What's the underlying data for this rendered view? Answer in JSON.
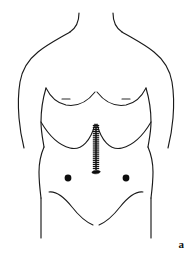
{
  "figure": {
    "panel_label": "a",
    "caption_alt": "Anterior view of male torso showing midline laparotomy incision closed with staples extending from xiphoid process to umbilicus, with two lateral port sites",
    "background_color": "#ffffff",
    "line_color": "#1a1a1a",
    "mark_color": "#0d0d0d",
    "width": 192,
    "height": 259
  },
  "anatomy": {
    "regions": [
      {
        "name": "neck",
        "label": "Neck"
      },
      {
        "name": "shoulders",
        "label": "Shoulders"
      },
      {
        "name": "chest",
        "label": "Chest"
      },
      {
        "name": "abdomen",
        "label": "Abdomen"
      },
      {
        "name": "pelvis",
        "label": "Pelvis"
      }
    ],
    "landmarks": [
      {
        "name": "left-nipple",
        "label": "Left nipple",
        "x": 66,
        "y": 100
      },
      {
        "name": "right-nipple",
        "label": "Right nipple",
        "x": 126,
        "y": 100
      },
      {
        "name": "xiphoid",
        "label": "Xiphoid process",
        "x": 96,
        "y": 124
      },
      {
        "name": "umbilicus",
        "label": "Umbilicus",
        "x": 96,
        "y": 172
      },
      {
        "name": "costal-margin",
        "label": "Costal margin"
      },
      {
        "name": "inguinal-crease",
        "label": "Inguinal crease"
      }
    ]
  },
  "surgical_markings": {
    "incision": {
      "name": "midline-laparotomy-incision",
      "label": "Midline laparotomy incision",
      "closure": "staples",
      "x": 96,
      "y_start": 124,
      "y_end": 170,
      "staple_count": 22,
      "staple_half_width": 3.2,
      "staple_spacing": 2.1,
      "color": "#111111"
    },
    "ports": [
      {
        "name": "left-port-site",
        "label": "Left port site",
        "x": 68,
        "y": 178,
        "radius": 3.4
      },
      {
        "name": "right-port-site",
        "label": "Right port site",
        "x": 126,
        "y": 178,
        "radius": 3.4
      }
    ]
  }
}
